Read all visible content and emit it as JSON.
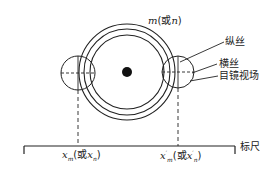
{
  "diagram": {
    "top_label": {
      "var": "m",
      "alt_prefix": "(或",
      "alt_var": "n",
      "alt_suffix": ")"
    },
    "callouts": [
      {
        "id": "vertical-wire",
        "label": "纵丝"
      },
      {
        "id": "horizontal-wire",
        "label": "横丝"
      },
      {
        "id": "eyepiece-field",
        "label": "目镜视场"
      }
    ],
    "scale_label": "标尺",
    "left_reading": {
      "var": "x",
      "sub": "m",
      "alt_prefix": "(或",
      "alt_var": "x",
      "alt_sub": "n",
      "alt_suffix": ")"
    },
    "right_reading": {
      "var": "x",
      "sup": "′",
      "sub": "m",
      "alt_prefix": "(或",
      "alt_var": "x",
      "alt_sup": "′",
      "alt_sub": "n",
      "alt_suffix": ")"
    }
  }
}
